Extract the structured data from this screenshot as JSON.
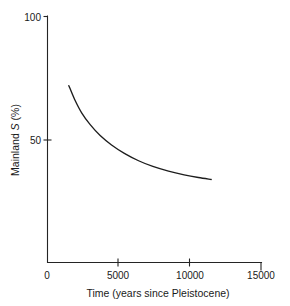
{
  "chart_data": {
    "type": "line",
    "title": "",
    "xlabel": "Time (years since Pleistocene)",
    "ylabel": "Mainland S (%)",
    "ylabel_parts": {
      "prefix": "Mainland ",
      "italic": "S",
      "suffix": " (%)"
    },
    "xlim": [
      0,
      15000
    ],
    "ylim": [
      0,
      100
    ],
    "xticks": [
      0,
      5000,
      10000,
      15000
    ],
    "xtick_labels": [
      "0",
      "5000",
      "10000",
      "15000"
    ],
    "yticks": [
      50,
      100
    ],
    "ytick_labels": [
      "50",
      "100"
    ],
    "grid": false,
    "legend": null,
    "series": [
      {
        "name": "Mainland S decay",
        "x": [
          1500,
          1900,
          2400,
          3000,
          3700,
          4500,
          5400,
          6400,
          7400,
          8500,
          9600,
          10600,
          11500
        ],
        "y": [
          72.0,
          66.5,
          61.0,
          56.2,
          51.8,
          48.0,
          44.6,
          41.6,
          39.3,
          37.4,
          35.9,
          34.8,
          34.0
        ]
      }
    ],
    "annotations": []
  },
  "axis": {
    "x_tick_values": [
      "0",
      "5000",
      "10000",
      "15000"
    ],
    "y_tick_values": [
      "100",
      "50"
    ],
    "x_axis_title": "Time (years since Pleistocene)",
    "y_axis_title": "Mainland S (%)"
  },
  "colors": {
    "curve": "#1d1d1d",
    "axis": "#242424",
    "background": "#ffffff",
    "text": "#1a1a1a"
  }
}
